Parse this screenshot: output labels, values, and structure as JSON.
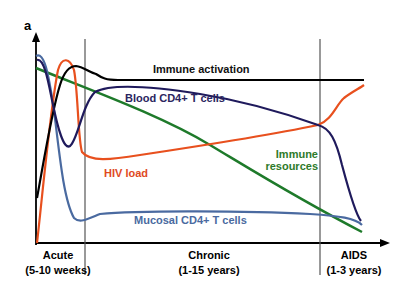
{
  "panel_label": "a",
  "phases": [
    {
      "name": "Acute",
      "duration": "(5-10 weeks)"
    },
    {
      "name": "Chronic",
      "duration": "(1-15 years)"
    },
    {
      "name": "AIDS",
      "duration": "(1-3 years)"
    }
  ],
  "curves": [
    {
      "label": "Immune activation",
      "color": "#000000"
    },
    {
      "label": "Blood CD4+ T cells",
      "color": "#1f1a5c"
    },
    {
      "label": "HIV load",
      "color": "#e8501e"
    },
    {
      "label": "Immune resources",
      "color": "#1e7a2a"
    },
    {
      "label": "Mucosal CD4+ T cells",
      "color": "#4a6aa0"
    }
  ],
  "label_colors": {
    "immune_activation": "#111111",
    "blood_cd4": "#2a2560",
    "hiv_load": "#e04a1e",
    "immune_resources": "#2e7a2a",
    "mucosal_cd4": "#4a6aa0"
  }
}
